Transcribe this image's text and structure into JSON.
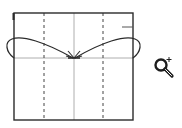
{
  "diagram": {
    "type": "folding-instruction",
    "square": {
      "x": 14,
      "y": 13,
      "width": 119,
      "height": 107,
      "stroke": "#2b2b2b"
    },
    "valley_fold_lines": [
      {
        "x1": 44,
        "y1": 13,
        "x2": 44,
        "y2": 120,
        "style": "dashed"
      },
      {
        "x1": 103,
        "y1": 13,
        "x2": 103,
        "y2": 120,
        "style": "dashed"
      }
    ],
    "crease_lines": [
      {
        "x1": 74,
        "y1": 13,
        "x2": 74,
        "y2": 120,
        "color": "#9a9a9a"
      },
      {
        "x1": 14,
        "y1": 58,
        "x2": 133,
        "y2": 58,
        "color": "#9a9a9a"
      }
    ],
    "edge_tick": {
      "x1": 122,
      "y1": 27,
      "x2": 133,
      "y2": 27
    },
    "arrows": [
      {
        "name": "left-fold-arrow",
        "direction": "to-center"
      },
      {
        "name": "right-fold-arrow",
        "direction": "to-center"
      }
    ],
    "colors": {
      "line": "#2b2b2b",
      "crease": "#9a9a9a",
      "background": "#ffffff"
    }
  },
  "controls": {
    "zoom_label": "Zoom in",
    "zoom_icon": "zoom-in-icon"
  }
}
